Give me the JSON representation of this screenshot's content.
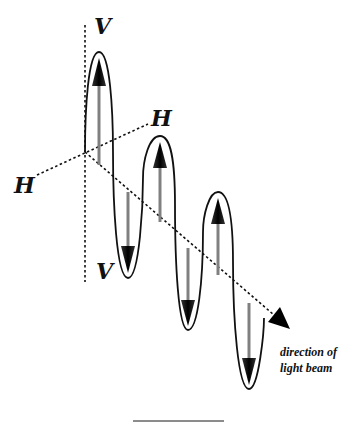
{
  "diagram": {
    "labels": {
      "v_top": "V",
      "v_bottom": "V",
      "h_left": "H",
      "h_right": "H",
      "caption_line1": "direction of",
      "caption_line2": "light beam"
    },
    "colors": {
      "axis": "#111111",
      "loop_outline": "#111111",
      "arrow_shaft": "#808080",
      "arrow_head": "#111111"
    },
    "oscillations": [
      {
        "direction": "up",
        "index": 1
      },
      {
        "direction": "down",
        "index": 1
      },
      {
        "direction": "up",
        "index": 2
      },
      {
        "direction": "down",
        "index": 2
      },
      {
        "direction": "up",
        "index": 3
      },
      {
        "direction": "down",
        "index": 3
      }
    ]
  }
}
